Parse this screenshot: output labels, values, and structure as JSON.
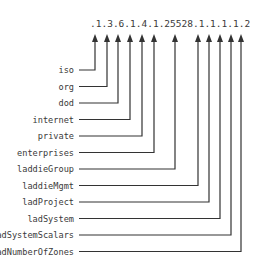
{
  "diagram": {
    "oid": ".1.3.6.1.4.1.25528.1.1.1.1.2",
    "oid_segments": [
      ".",
      "1",
      ".",
      "3",
      ".",
      "6",
      ".",
      "1",
      ".",
      "4",
      ".",
      "1",
      ".",
      "25528",
      ".",
      "1",
      ".",
      "1",
      ".",
      "1",
      ".",
      "1",
      ".",
      "2"
    ],
    "nodes": [
      {
        "label": "iso",
        "value": "1"
      },
      {
        "label": "org",
        "value": "3"
      },
      {
        "label": "dod",
        "value": "6"
      },
      {
        "label": "internet",
        "value": "1"
      },
      {
        "label": "private",
        "value": "4"
      },
      {
        "label": "enterprises",
        "value": "1"
      },
      {
        "label": "laddieGroup",
        "value": "25528"
      },
      {
        "label": "laddieMgmt",
        "value": "1"
      },
      {
        "label": "ladProject",
        "value": "1"
      },
      {
        "label": "ladSystem",
        "value": "1"
      },
      {
        "label": "ladSystemScalars",
        "value": "1"
      },
      {
        "label": "ladNumberOfZones",
        "value": "2"
      }
    ],
    "colors": {
      "line": "#333333",
      "text": "#3a3a3a",
      "background": "#ffffff"
    }
  }
}
